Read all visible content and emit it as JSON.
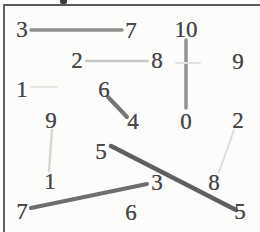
{
  "figure": {
    "background": "#fcfcfa",
    "frame": {
      "border_color": "#5a5a5a"
    },
    "text_color": "#474747",
    "nodes": [
      {
        "label": "3",
        "x": 22,
        "y": 30
      },
      {
        "label": "7",
        "x": 131,
        "y": 31
      },
      {
        "label": "2",
        "x": 77,
        "y": 61
      },
      {
        "label": "8",
        "x": 157,
        "y": 61
      },
      {
        "label": "10",
        "x": 186,
        "y": 30
      },
      {
        "label": "9",
        "x": 238,
        "y": 62
      },
      {
        "label": "1",
        "x": 22,
        "y": 90
      },
      {
        "label": "6",
        "x": 104,
        "y": 90
      },
      {
        "label": "4",
        "x": 133,
        "y": 122
      },
      {
        "label": "0",
        "x": 186,
        "y": 122
      },
      {
        "label": "9",
        "x": 51,
        "y": 121
      },
      {
        "label": "2",
        "x": 238,
        "y": 121
      },
      {
        "label": "5",
        "x": 101,
        "y": 152
      },
      {
        "label": "1",
        "x": 50,
        "y": 182
      },
      {
        "label": "3",
        "x": 157,
        "y": 183
      },
      {
        "label": "8",
        "x": 214,
        "y": 183
      },
      {
        "label": "7",
        "x": 22,
        "y": 212
      },
      {
        "label": "6",
        "x": 131,
        "y": 213
      },
      {
        "label": "5",
        "x": 240,
        "y": 212
      }
    ],
    "edges": [
      {
        "name": "3-7",
        "x1": 31,
        "y1": 30,
        "x2": 122,
        "y2": 30,
        "color": "#8e8e8e",
        "width": 3.5
      },
      {
        "name": "2-8",
        "x1": 86,
        "y1": 61,
        "x2": 148,
        "y2": 61,
        "color": "#c8c8c8",
        "width": 2.5
      },
      {
        "name": "10-0",
        "x1": 186,
        "y1": 40,
        "x2": 186,
        "y2": 108,
        "color": "#929292",
        "width": 3.5
      },
      {
        "name": "6-4",
        "x1": 108,
        "y1": 97,
        "x2": 127,
        "y2": 117,
        "color": "#757575",
        "width": 4
      },
      {
        "name": "9-1",
        "x1": 52,
        "y1": 130,
        "x2": 49,
        "y2": 171,
        "color": "#d8d8d3",
        "width": 2.5
      },
      {
        "name": "5-5",
        "x1": 111,
        "y1": 146,
        "x2": 236,
        "y2": 210,
        "color": "#5f5f5f",
        "width": 4.5
      },
      {
        "name": "2-8-right",
        "x1": 234,
        "y1": 130,
        "x2": 219,
        "y2": 172,
        "color": "#dcdcdc",
        "width": 2
      },
      {
        "name": "7-3",
        "x1": 31,
        "y1": 208,
        "x2": 147,
        "y2": 184,
        "color": "#6e6e6e",
        "width": 4
      },
      {
        "name": "faint-1",
        "x1": 31,
        "y1": 87,
        "x2": 57,
        "y2": 87,
        "color": "#e6e6e3",
        "width": 2
      },
      {
        "name": "faint-8-9",
        "x1": 176,
        "y1": 63,
        "x2": 200,
        "y2": 63,
        "color": "#e2e2e0",
        "width": 2
      }
    ]
  }
}
